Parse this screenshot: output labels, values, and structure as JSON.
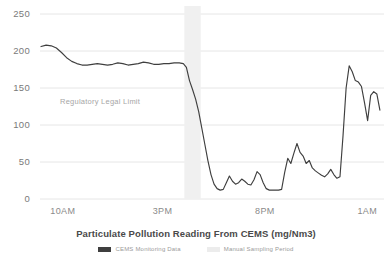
{
  "chart_data": {
    "type": "line",
    "title": "Particulate Pollution Reading From CEMS (mg/Nm3)",
    "xlabel": "",
    "ylabel": "",
    "ylim": [
      0,
      250
    ],
    "yticks": [
      0,
      50,
      100,
      150,
      200,
      250
    ],
    "ytick_labels": [
      "0",
      "50",
      "100",
      "150",
      "200",
      "250"
    ],
    "grid": true,
    "legend_position": "bottom",
    "xtick_labels": [
      "10AM",
      "3PM",
      "8PM",
      "1AM"
    ],
    "xtick_values": [
      10,
      15,
      20,
      25
    ],
    "xlim": [
      9.4,
      26.2
    ],
    "annotations": [
      {
        "text": "Regulatory Legal Limit",
        "y": 150,
        "x": 11.2
      }
    ],
    "shaded_region": {
      "label": "Manual Sampling Period",
      "x_start": 16.45,
      "x_end": 17.25,
      "color": "#f0f0f0"
    },
    "series": [
      {
        "name": "CEMS Monitoring Data",
        "color": "#3f3f3f",
        "x": [
          9.45,
          9.7,
          9.95,
          10.2,
          10.45,
          10.7,
          10.95,
          11.2,
          11.45,
          11.7,
          11.95,
          12.2,
          12.45,
          12.7,
          12.95,
          13.2,
          13.45,
          13.7,
          13.95,
          14.2,
          14.45,
          14.7,
          14.95,
          15.2,
          15.45,
          15.7,
          15.95,
          16.2,
          16.4,
          16.55,
          16.7,
          16.85,
          17.0,
          17.15,
          17.3,
          17.45,
          17.6,
          17.75,
          17.9,
          18.05,
          18.2,
          18.35,
          18.5,
          18.65,
          18.8,
          18.95,
          19.1,
          19.25,
          19.4,
          19.55,
          19.7,
          19.85,
          20.0,
          20.15,
          20.3,
          20.45,
          20.6,
          20.75,
          20.9,
          21.05,
          21.2,
          21.35,
          21.5,
          21.65,
          21.8,
          21.95,
          22.1,
          22.25,
          22.4,
          22.55,
          22.7,
          22.85,
          23.0,
          23.15,
          23.3,
          23.45,
          23.6,
          23.75,
          23.9,
          24.05,
          24.2,
          24.35,
          24.5,
          24.65,
          24.8,
          24.95,
          25.1,
          25.25,
          25.4,
          25.55,
          25.7,
          25.85,
          26.0
        ],
        "values": [
          206,
          208,
          207,
          204,
          198,
          191,
          186,
          183,
          181,
          181,
          182,
          183,
          182,
          181,
          182,
          184,
          183,
          181,
          182,
          183,
          185,
          184,
          182,
          182,
          183,
          183,
          184,
          184,
          183,
          178,
          160,
          148,
          135,
          118,
          96,
          74,
          52,
          33,
          20,
          14,
          12,
          13,
          22,
          31,
          24,
          20,
          22,
          27,
          24,
          20,
          19,
          26,
          37,
          33,
          22,
          14,
          12,
          12,
          12,
          12,
          13,
          36,
          55,
          48,
          62,
          75,
          63,
          58,
          48,
          52,
          42,
          38,
          35,
          32,
          30,
          34,
          40,
          33,
          28,
          30,
          86,
          150,
          180,
          172,
          160,
          158,
          152,
          130,
          106,
          140,
          145,
          142,
          120
        ]
      }
    ]
  },
  "legend": {
    "items": [
      {
        "label": "CEMS Monitoring Data",
        "color": "#3f3f3f",
        "type": "line"
      },
      {
        "label": "Manual Sampling Period",
        "color": "#ececec",
        "type": "band"
      }
    ]
  }
}
